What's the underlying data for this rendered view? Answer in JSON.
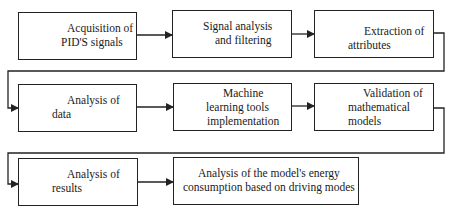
{
  "diagram": {
    "type": "flowchart",
    "line_color": "#222222",
    "nodes": [
      {
        "id": "n1",
        "line1": "Acquisition of",
        "line2": "PID'S signals"
      },
      {
        "id": "n2",
        "line1": "Signal analysis",
        "line2": "and filtering"
      },
      {
        "id": "n3",
        "line1": "Extraction of",
        "line2": "attributes"
      },
      {
        "id": "n4",
        "line1": "Analysis of",
        "line2": "data"
      },
      {
        "id": "n5",
        "line1": "Machine",
        "line2": "learning tools",
        "line3": "implementation"
      },
      {
        "id": "n6",
        "line1": "Validation of",
        "line2": "mathematical",
        "line3": "models"
      },
      {
        "id": "n7",
        "line1": "Analysis of",
        "line2": "results"
      },
      {
        "id": "n8",
        "line1": "Analysis of the model's energy",
        "line2": "consumption based on driving modes"
      }
    ],
    "edges": [
      {
        "from": "n1",
        "to": "n2"
      },
      {
        "from": "n2",
        "to": "n3"
      },
      {
        "from": "n3",
        "to": "n4"
      },
      {
        "from": "n4",
        "to": "n5"
      },
      {
        "from": "n5",
        "to": "n6"
      },
      {
        "from": "n6",
        "to": "n7"
      },
      {
        "from": "n7",
        "to": "n8"
      }
    ]
  }
}
